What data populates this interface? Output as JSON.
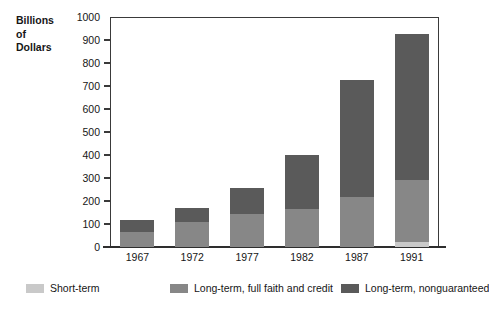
{
  "chart_data": {
    "type": "bar",
    "subtype": "stacked-bar",
    "title": "",
    "xlabel": "",
    "ylabel": "Billions of Dollars",
    "ylabel_lines": [
      "Billions",
      "of",
      "Dollars"
    ],
    "categories": [
      "1967",
      "1972",
      "1977",
      "1982",
      "1987",
      "1991"
    ],
    "ylim": [
      0,
      1000
    ],
    "yticks": [
      0,
      100,
      200,
      300,
      400,
      500,
      600,
      700,
      800,
      900,
      1000
    ],
    "ytick_labels": [
      "0",
      "100",
      "200",
      "300",
      "400",
      "500",
      "600",
      "700",
      "800",
      "900",
      "1000"
    ],
    "grid": false,
    "legend_position": "bottom",
    "series": [
      {
        "name": "Short-term",
        "color": "#c9c9c9",
        "values": [
          0,
          0,
          0,
          0,
          0,
          20
        ]
      },
      {
        "name": "Long-term, full faith and credit",
        "color": "#878787",
        "values": [
          65,
          108,
          145,
          165,
          218,
          270
        ]
      },
      {
        "name": "Long-term, nonguaranteed",
        "color": "#5a5a5a",
        "values": [
          53,
          62,
          113,
          235,
          507,
          635
        ]
      }
    ],
    "totals": [
      118,
      170,
      258,
      400,
      725,
      925
    ]
  },
  "legend": {
    "items": [
      {
        "label": "Short-term",
        "color": "#c9c9c9"
      },
      {
        "label": "Long-term, full faith and credit",
        "color": "#878787"
      },
      {
        "label": "Long-term, nonguaranteed",
        "color": "#5a5a5a"
      }
    ]
  },
  "colors": {
    "axis": "#3a3a3a",
    "text": "#161616",
    "background": "#ffffff"
  }
}
